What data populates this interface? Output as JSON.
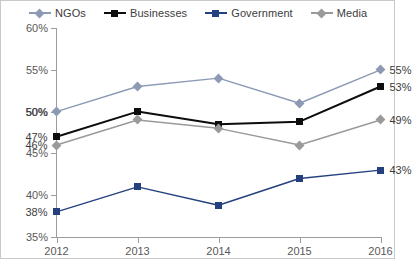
{
  "legend": {
    "position": "top",
    "items": [
      {
        "label": "NGOs",
        "marker": "diamond",
        "color": "#8c9ab4"
      },
      {
        "label": "Businesses",
        "marker": "square",
        "color": "#0d0d0d"
      },
      {
        "label": "Government",
        "marker": "square",
        "color": "#24407e"
      },
      {
        "label": "Media",
        "marker": "diamond",
        "color": "#9a9a9a"
      }
    ]
  },
  "axes": {
    "y_ticks": [
      "35%",
      "40%",
      "45%",
      "50%",
      "55%",
      "60%"
    ],
    "x_ticks": [
      "2012",
      "2013",
      "2014",
      "2015",
      "2016"
    ]
  },
  "labels": {
    "left": [
      "50%",
      "47%",
      "46%",
      "38%"
    ],
    "right": [
      "55%",
      "53%",
      "49%",
      "43%"
    ]
  },
  "chart_data": {
    "type": "line",
    "title": "",
    "subtitle": "",
    "xlabel": "",
    "ylabel": "",
    "categories": [
      "2012",
      "2013",
      "2014",
      "2015",
      "2016"
    ],
    "ylim": [
      35,
      60
    ],
    "ytick_values": [
      35,
      40,
      45,
      50,
      55,
      60
    ],
    "ytick_format": "percent",
    "grid": false,
    "legend_position": "top",
    "series": [
      {
        "name": "NGOs",
        "color": "#8c9ab4",
        "marker": "diamond",
        "values": [
          50,
          53,
          54,
          51,
          55
        ],
        "start_label": "50%",
        "end_label": "55%"
      },
      {
        "name": "Businesses",
        "color": "#0d0d0d",
        "marker": "square",
        "values": [
          47,
          50,
          48.5,
          48.8,
          53
        ],
        "start_label": "47%",
        "end_label": "53%"
      },
      {
        "name": "Government",
        "color": "#24407e",
        "marker": "square",
        "values": [
          38,
          41,
          38.8,
          42,
          43
        ],
        "start_label": "38%",
        "end_label": "43%"
      },
      {
        "name": "Media",
        "color": "#9a9a9a",
        "marker": "diamond",
        "values": [
          46,
          49,
          48,
          46,
          49
        ],
        "start_label": "46%",
        "end_label": "49%"
      }
    ]
  }
}
